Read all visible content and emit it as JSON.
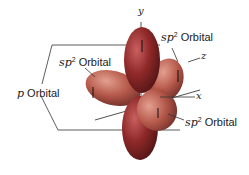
{
  "labels": {
    "sp2_top_left": {
      "prefix": "sp",
      "sup": "2",
      "text": " Orbital"
    },
    "sp2_top_right": {
      "prefix": "sp",
      "sup": "2",
      "text": " Orbital"
    },
    "sp2_bottom_right": {
      "prefix": "sp",
      "sup": "2",
      "text": " Orbital"
    },
    "p_orbital": {
      "prefix": "p",
      "text": " Orbital"
    }
  },
  "axes": {
    "y": "y",
    "z": "z",
    "x": "x"
  },
  "colors": {
    "p_lobe": "#8c2a2a",
    "sp2_lobe": "#b3584a",
    "lines": "#333333"
  }
}
